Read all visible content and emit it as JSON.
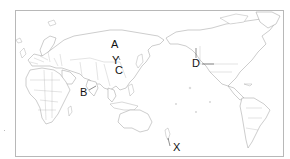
{
  "map": {
    "projection": "Pacific-centered world map",
    "style": "outline, gray borders on white",
    "frame_color": "#b8b8b8",
    "outline_color": "#9a9a9a"
  },
  "labels": {
    "A": "A",
    "Y": "Y",
    "C": "C",
    "B": "B",
    "D": "D",
    "X": "X"
  }
}
